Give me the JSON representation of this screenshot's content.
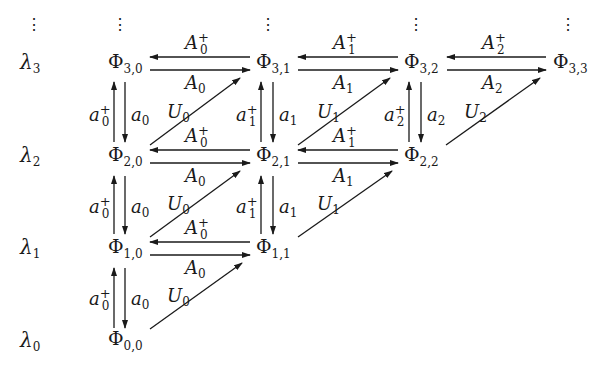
{
  "diagram": {
    "type": "commutative-lattice",
    "eigenvalue_labels": [
      {
        "id": "lambda3",
        "symbol": "λ",
        "sub": "3",
        "row": 3
      },
      {
        "id": "lambda2",
        "symbol": "λ",
        "sub": "2",
        "row": 2
      },
      {
        "id": "lambda1",
        "symbol": "λ",
        "sub": "1",
        "row": 1
      },
      {
        "id": "lambda0",
        "symbol": "λ",
        "sub": "0",
        "row": 0
      }
    ],
    "continuation_dots": "⋮",
    "nodes": [
      {
        "id": "phi_3_0",
        "symbol": "Φ",
        "sub": "3,0"
      },
      {
        "id": "phi_3_1",
        "symbol": "Φ",
        "sub": "3,1"
      },
      {
        "id": "phi_3_2",
        "symbol": "Φ",
        "sub": "3,2"
      },
      {
        "id": "phi_3_3",
        "symbol": "Φ",
        "sub": "3,3"
      },
      {
        "id": "phi_2_0",
        "symbol": "Φ",
        "sub": "2,0"
      },
      {
        "id": "phi_2_1",
        "symbol": "Φ",
        "sub": "2,1"
      },
      {
        "id": "phi_2_2",
        "symbol": "Φ",
        "sub": "2,2"
      },
      {
        "id": "phi_1_0",
        "symbol": "Φ",
        "sub": "1,0"
      },
      {
        "id": "phi_1_1",
        "symbol": "Φ",
        "sub": "1,1"
      },
      {
        "id": "phi_0_0",
        "symbol": "Φ",
        "sub": "0,0"
      }
    ],
    "edge_labels": {
      "horizontal_left": [
        {
          "from": "phi_3_1",
          "to": "phi_3_0",
          "symbol": "A",
          "sub": "0",
          "sup": "+"
        },
        {
          "from": "phi_3_2",
          "to": "phi_3_1",
          "symbol": "A",
          "sub": "1",
          "sup": "+"
        },
        {
          "from": "phi_3_3",
          "to": "phi_3_2",
          "symbol": "A",
          "sub": "2",
          "sup": "+"
        },
        {
          "from": "phi_2_1",
          "to": "phi_2_0",
          "symbol": "A",
          "sub": "0",
          "sup": "+"
        },
        {
          "from": "phi_2_2",
          "to": "phi_2_1",
          "symbol": "A",
          "sub": "1",
          "sup": "+"
        },
        {
          "from": "phi_1_1",
          "to": "phi_1_0",
          "symbol": "A",
          "sub": "0",
          "sup": "+"
        }
      ],
      "horizontal_right": [
        {
          "from": "phi_3_0",
          "to": "phi_3_1",
          "symbol": "A",
          "sub": "0"
        },
        {
          "from": "phi_3_1",
          "to": "phi_3_2",
          "symbol": "A",
          "sub": "1"
        },
        {
          "from": "phi_3_2",
          "to": "phi_3_3",
          "symbol": "A",
          "sub": "2"
        },
        {
          "from": "phi_2_0",
          "to": "phi_2_1",
          "symbol": "A",
          "sub": "0"
        },
        {
          "from": "phi_2_1",
          "to": "phi_2_2",
          "symbol": "A",
          "sub": "1"
        },
        {
          "from": "phi_1_0",
          "to": "phi_1_1",
          "symbol": "A",
          "sub": "0"
        }
      ],
      "vertical_up": [
        {
          "from": "phi_2_0",
          "to": "phi_3_0",
          "symbol": "a",
          "sub": "0",
          "sup": "+"
        },
        {
          "from": "phi_2_1",
          "to": "phi_3_1",
          "symbol": "a",
          "sub": "1",
          "sup": "+"
        },
        {
          "from": "phi_2_2",
          "to": "phi_3_2",
          "symbol": "a",
          "sub": "2",
          "sup": "+"
        },
        {
          "from": "phi_1_0",
          "to": "phi_2_0",
          "symbol": "a",
          "sub": "0",
          "sup": "+"
        },
        {
          "from": "phi_1_1",
          "to": "phi_2_1",
          "symbol": "a",
          "sub": "1",
          "sup": "+"
        },
        {
          "from": "phi_0_0",
          "to": "phi_1_0",
          "symbol": "a",
          "sub": "0",
          "sup": "+"
        }
      ],
      "vertical_down": [
        {
          "from": "phi_3_0",
          "to": "phi_2_0",
          "symbol": "a",
          "sub": "0"
        },
        {
          "from": "phi_3_1",
          "to": "phi_2_1",
          "symbol": "a",
          "sub": "1"
        },
        {
          "from": "phi_3_2",
          "to": "phi_2_2",
          "symbol": "a",
          "sub": "2"
        },
        {
          "from": "phi_2_0",
          "to": "phi_1_0",
          "symbol": "a",
          "sub": "0"
        },
        {
          "from": "phi_2_1",
          "to": "phi_1_1",
          "symbol": "a",
          "sub": "1"
        },
        {
          "from": "phi_1_0",
          "to": "phi_0_0",
          "symbol": "a",
          "sub": "0"
        }
      ],
      "diagonal": [
        {
          "from": "phi_2_0",
          "to": "phi_3_1",
          "symbol": "U",
          "sub": "0"
        },
        {
          "from": "phi_2_1",
          "to": "phi_3_2",
          "symbol": "U",
          "sub": "1"
        },
        {
          "from": "phi_2_2",
          "to": "phi_3_3",
          "symbol": "U",
          "sub": "2"
        },
        {
          "from": "phi_1_0",
          "to": "phi_2_1",
          "symbol": "U",
          "sub": "0"
        },
        {
          "from": "phi_1_1",
          "to": "phi_2_2",
          "symbol": "U",
          "sub": "1"
        },
        {
          "from": "phi_0_0",
          "to": "phi_1_1",
          "symbol": "U",
          "sub": "0"
        }
      ]
    }
  }
}
